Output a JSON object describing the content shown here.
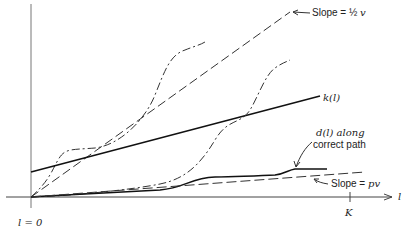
{
  "diagram": {
    "axes": {
      "x_label": "l",
      "origin_label": "l = 0",
      "x_tick_label": "K"
    },
    "curves": {
      "k": {
        "label": "k(l)"
      },
      "d": {
        "label_line1": "d(l) along",
        "label_line2": "correct path"
      },
      "slope_high": {
        "label_prefix": "Slope = ",
        "label_frac": "½",
        "label_var": "v"
      },
      "slope_low": {
        "label_prefix": "Slope = ",
        "label_var": "pv"
      }
    }
  }
}
